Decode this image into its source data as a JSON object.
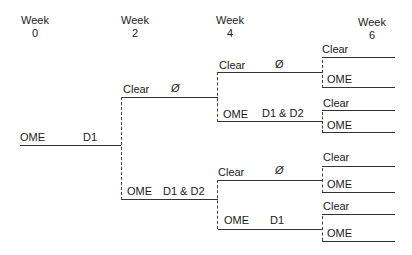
{
  "weeks": [
    {
      "label": "Week",
      "num": "0"
    },
    {
      "label": "Week",
      "num": "2"
    },
    {
      "label": "Week",
      "num": "4"
    },
    {
      "label": "Week",
      "num": "6"
    }
  ],
  "week0": {
    "state": "OME",
    "treatment": "D1"
  },
  "week2": {
    "upper": {
      "state": "Clear",
      "treatment": "Ø"
    },
    "lower": {
      "state": "OME",
      "treatment": "D1 & D2"
    }
  },
  "week4": {
    "a": {
      "state": "Clear",
      "treatment": "Ø"
    },
    "b": {
      "state": "OME",
      "treatment": "D1 & D2"
    },
    "c": {
      "state": "Clear",
      "treatment": "Ø"
    },
    "d": {
      "state": "OME",
      "treatment": "D1"
    }
  },
  "week6": [
    {
      "state": "Clear"
    },
    {
      "state": "OME"
    },
    {
      "state": "Clear"
    },
    {
      "state": "OME"
    },
    {
      "state": "Clear"
    },
    {
      "state": "OME"
    },
    {
      "state": "Clear"
    },
    {
      "state": "OME"
    }
  ]
}
